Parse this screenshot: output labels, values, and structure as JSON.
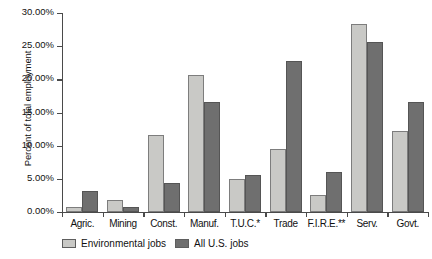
{
  "chart_data": {
    "type": "bar",
    "title": "",
    "subtitle": "",
    "xlabel": "",
    "ylabel": "Percent of total employment",
    "ylim": [
      0,
      30
    ],
    "ytick_labels": [
      "0.00%",
      "5.00%",
      "10.00%",
      "15.00%",
      "20.00%",
      "25.00%",
      "30.00%"
    ],
    "ytick_values": [
      0,
      5,
      10,
      15,
      20,
      25,
      30
    ],
    "grid": false,
    "legend_position": "bottom-left",
    "categories": [
      "Agric.",
      "Mining",
      "Const.",
      "Manuf.",
      "T.U.C.*",
      "Trade",
      "F.I.R.E.**",
      "Serv.",
      "Govt."
    ],
    "series": [
      {
        "name": "Environmental jobs",
        "color": "#c9c9c6",
        "values": [
          0.7,
          1.8,
          11.6,
          20.6,
          5.0,
          9.5,
          2.5,
          28.3,
          12.2
        ]
      },
      {
        "name": "All U.S. jobs",
        "color": "#6f6f6f",
        "values": [
          3.1,
          0.7,
          4.3,
          16.6,
          5.6,
          22.8,
          6.1,
          25.6,
          16.6
        ]
      }
    ]
  }
}
